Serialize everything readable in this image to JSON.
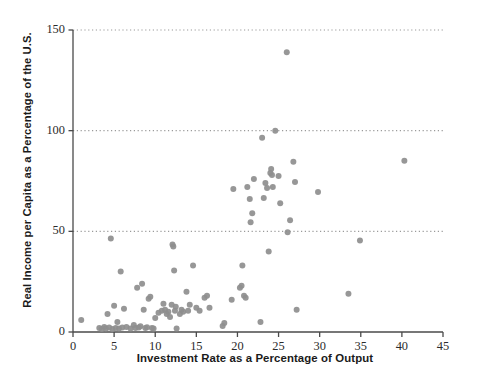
{
  "chart_data": {
    "type": "scatter",
    "title": "",
    "subtitle": "",
    "xlabel": "Investment Rate as a Percentage of Output",
    "ylabel": "Real Income per Capita as a Percentage of the U.S.",
    "xlim": [
      0,
      45
    ],
    "ylim": [
      0,
      150
    ],
    "xticks": [
      0,
      5,
      10,
      15,
      20,
      25,
      30,
      35,
      40,
      45
    ],
    "yticks": [
      0,
      50,
      100,
      150
    ],
    "xtick_labels": [
      "0",
      "5",
      "10",
      "15",
      "20",
      "25",
      "30",
      "35",
      "40",
      "45"
    ],
    "ytick_labels": [
      "0",
      "50",
      "100",
      "150"
    ],
    "grid": "horizontal-dotted at y = 50, 100, 150",
    "legend": "none",
    "marker": {
      "shape": "circle",
      "color": "#8e8e8e",
      "size_px": 4.2
    },
    "axis_color": "#4a4a4a",
    "gridline_color": "#9a9a9a",
    "annotations": [],
    "points": [
      [
        1.0,
        6.0
      ],
      [
        3.2,
        2.0
      ],
      [
        3.5,
        1.5
      ],
      [
        3.8,
        2.5
      ],
      [
        4.0,
        1.8
      ],
      [
        4.2,
        9.0
      ],
      [
        4.4,
        2.2
      ],
      [
        4.6,
        46.5
      ],
      [
        4.8,
        1.5
      ],
      [
        5.0,
        13.0
      ],
      [
        5.2,
        2.0
      ],
      [
        5.4,
        5.0
      ],
      [
        5.6,
        1.8
      ],
      [
        5.8,
        30.0
      ],
      [
        6.0,
        2.2
      ],
      [
        6.2,
        11.5
      ],
      [
        6.5,
        2.5
      ],
      [
        7.0,
        1.8
      ],
      [
        7.4,
        3.5
      ],
      [
        7.6,
        2.0
      ],
      [
        7.8,
        22.0
      ],
      [
        8.0,
        2.2
      ],
      [
        8.2,
        2.8
      ],
      [
        8.4,
        24.0
      ],
      [
        8.6,
        11.0
      ],
      [
        8.8,
        2.0
      ],
      [
        9.0,
        2.4
      ],
      [
        9.2,
        16.5
      ],
      [
        9.4,
        17.5
      ],
      [
        9.6,
        2.0
      ],
      [
        9.8,
        1.8
      ],
      [
        10.0,
        7.0
      ],
      [
        10.4,
        9.5
      ],
      [
        10.8,
        10.5
      ],
      [
        11.0,
        14.0
      ],
      [
        11.2,
        11.0
      ],
      [
        11.4,
        9.0
      ],
      [
        11.6,
        10.0
      ],
      [
        11.8,
        7.5
      ],
      [
        12.0,
        13.5
      ],
      [
        12.1,
        43.5
      ],
      [
        12.2,
        42.5
      ],
      [
        12.3,
        30.5
      ],
      [
        12.4,
        10.5
      ],
      [
        12.5,
        12.5
      ],
      [
        12.6,
        1.8
      ],
      [
        13.0,
        9.0
      ],
      [
        13.2,
        11.0
      ],
      [
        13.4,
        10.0
      ],
      [
        13.8,
        20.0
      ],
      [
        14.0,
        10.5
      ],
      [
        14.2,
        13.5
      ],
      [
        14.6,
        33.0
      ],
      [
        15.0,
        12.0
      ],
      [
        15.4,
        10.5
      ],
      [
        16.0,
        17.0
      ],
      [
        16.3,
        18.0
      ],
      [
        16.6,
        12.0
      ],
      [
        18.2,
        3.0
      ],
      [
        18.4,
        4.5
      ],
      [
        19.3,
        16.0
      ],
      [
        19.5,
        71.0
      ],
      [
        20.3,
        22.0
      ],
      [
        20.5,
        23.0
      ],
      [
        20.6,
        33.0
      ],
      [
        20.8,
        18.0
      ],
      [
        21.0,
        17.0
      ],
      [
        21.2,
        72.0
      ],
      [
        21.5,
        66.0
      ],
      [
        21.6,
        54.5
      ],
      [
        21.8,
        59.0
      ],
      [
        22.0,
        76.0
      ],
      [
        22.8,
        5.0
      ],
      [
        23.0,
        96.5
      ],
      [
        23.2,
        66.5
      ],
      [
        23.4,
        74.0
      ],
      [
        23.6,
        71.5
      ],
      [
        23.8,
        40.0
      ],
      [
        24.0,
        79.0
      ],
      [
        24.1,
        81.0
      ],
      [
        24.2,
        78.0
      ],
      [
        24.3,
        72.0
      ],
      [
        24.6,
        100.0
      ],
      [
        25.0,
        77.5
      ],
      [
        25.2,
        64.0
      ],
      [
        26.0,
        139.0
      ],
      [
        26.1,
        49.5
      ],
      [
        26.4,
        55.5
      ],
      [
        26.8,
        84.5
      ],
      [
        27.0,
        74.5
      ],
      [
        27.2,
        11.0
      ],
      [
        29.8,
        69.5
      ],
      [
        33.5,
        19.0
      ],
      [
        34.9,
        45.5
      ],
      [
        40.3,
        85.0
      ]
    ]
  },
  "axis": {
    "x_label": "Investment Rate as a Percentage of Output",
    "y_label": "Real Income per Capita as a Percentage of the U.S."
  }
}
